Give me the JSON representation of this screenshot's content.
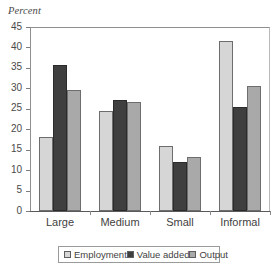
{
  "chart_data": {
    "type": "bar",
    "title": "",
    "ylabel": "Percent",
    "xlabel": "",
    "ylim": [
      0,
      45
    ],
    "yticks": [
      0,
      5,
      10,
      15,
      20,
      25,
      30,
      35,
      40,
      45
    ],
    "grid": false,
    "legend_position": "bottom",
    "categories": [
      "Large",
      "Medium",
      "Small",
      "Informal"
    ],
    "series": [
      {
        "name": "Employment",
        "color": "#d6d6d6",
        "values": [
          18.1,
          24.5,
          15.9,
          41.5
        ]
      },
      {
        "name": "Value added",
        "color": "#3f3f3f",
        "values": [
          35.7,
          27.2,
          11.9,
          25.4
        ]
      },
      {
        "name": "Output",
        "color": "#a9a9a9",
        "values": [
          29.5,
          26.7,
          13.2,
          30.6
        ]
      }
    ]
  },
  "legend": {
    "entries": [
      {
        "label": "Employment",
        "swatch": "legend-swatch-employment"
      },
      {
        "label": "Value added",
        "swatch": "legend-swatch-value-added"
      },
      {
        "label": "Output",
        "swatch": "legend-swatch-output"
      }
    ]
  }
}
